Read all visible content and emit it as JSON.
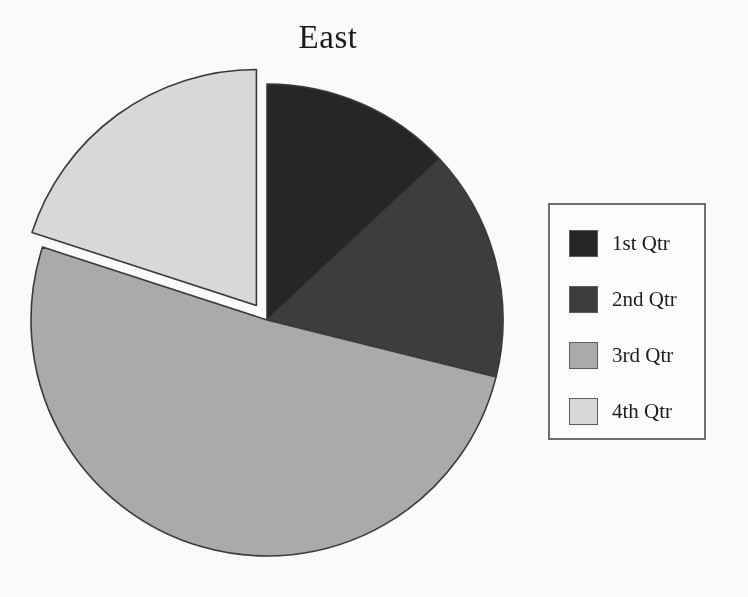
{
  "chart_data": {
    "type": "pie",
    "title": "East",
    "xlabel": "",
    "ylabel": "",
    "categories": [
      "1st Qtr",
      "2nd Qtr",
      "3rd Qtr",
      "4th Qtr"
    ],
    "values": [
      13,
      16,
      51,
      20
    ],
    "unit": "percent",
    "start_angle_deg": 0,
    "direction": "clockwise",
    "exploded_slices": [
      "4th Qtr"
    ],
    "explode_offset_px": 18,
    "grid": false,
    "legend_position": "right",
    "slices": [
      {
        "label": "1st Qtr",
        "value": 13,
        "color": "#262626",
        "start_angle_deg": 0,
        "end_angle_deg": 47,
        "exploded": false
      },
      {
        "label": "2nd Qtr",
        "value": 16,
        "color": "#3d3d3d",
        "start_angle_deg": 47,
        "end_angle_deg": 104,
        "exploded": false
      },
      {
        "label": "3rd Qtr",
        "value": 51,
        "color": "#ababab",
        "start_angle_deg": 104,
        "end_angle_deg": 288,
        "exploded": false
      },
      {
        "label": "4th Qtr",
        "value": 20,
        "color": "#d9d9d9",
        "start_angle_deg": 288,
        "end_angle_deg": 360,
        "exploded": true
      }
    ]
  },
  "title": {
    "text": "East"
  },
  "legend": {
    "entries": [
      {
        "label": "1st Qtr",
        "color": "#262626"
      },
      {
        "label": "2nd Qtr",
        "color": "#3d3d3d"
      },
      {
        "label": "3rd Qtr",
        "color": "#ababab"
      },
      {
        "label": "4th Qtr",
        "color": "#d9d9d9"
      }
    ]
  },
  "style": {
    "background": "#fbfbfa",
    "slice_outline": "#3a3a3a",
    "legend_border": "#6f6f73",
    "text_color": "#1b1b1b"
  }
}
